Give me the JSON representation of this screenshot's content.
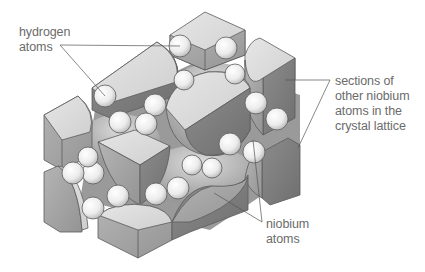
{
  "diagram": {
    "type": "crystal-lattice-illustration",
    "colors": {
      "background": "#ffffff",
      "label_text": "#6b6b6b",
      "leader_line": "#555555",
      "niobium_face_light": "#d9d9d9",
      "niobium_face_mid": "#a6a6a6",
      "niobium_face_dark": "#7f7f7f",
      "hydrogen_sphere": "#f4f4f4"
    },
    "labels": {
      "hydrogen": {
        "lines": [
          "hydrogen",
          "atoms"
        ]
      },
      "sections": {
        "lines": [
          "sections of",
          "other niobium",
          "atoms in the",
          "crystal lattice"
        ]
      },
      "niobium": {
        "lines": [
          "niobium",
          "atoms"
        ]
      }
    }
  }
}
